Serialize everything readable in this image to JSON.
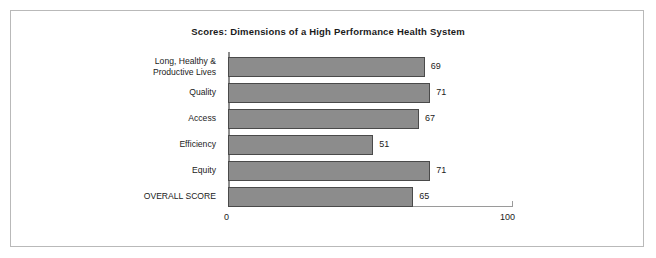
{
  "chart_data": {
    "type": "bar",
    "orientation": "horizontal",
    "title": "Scores: Dimensions of a High Performance Health System",
    "xlabel": "",
    "ylabel": "",
    "categories": [
      "Long, Healthy &\nProductive Lives",
      "Quality",
      "Access",
      "Efficiency",
      "Equity",
      "OVERALL SCORE"
    ],
    "values": [
      69,
      71,
      67,
      51,
      71,
      65
    ],
    "data_labels": [
      "69",
      "71",
      "67",
      "51",
      "71",
      "65"
    ],
    "xlim": [
      0,
      100
    ],
    "xticks": [
      0,
      100
    ],
    "xtick_labels": [
      "0",
      "100"
    ],
    "grid": false,
    "legend": false,
    "bar_color": "#8c8c8c",
    "bar_border_color": "#4a4a4a",
    "axis_color": "#9a9a9a",
    "text_color": "#1b1b1b",
    "background": "#ffffff",
    "frame_color": "#b9b9b9"
  }
}
